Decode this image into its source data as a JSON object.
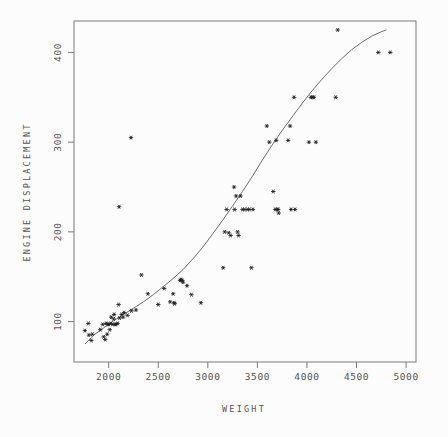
{
  "figure": {
    "background_color": "#fcfcfc",
    "frame_color": "#7a7a7a",
    "marker_color": "#1a1a1a",
    "curve_color": "#6e6e6e",
    "text_color": "#555555"
  },
  "chart_data": {
    "type": "scatter",
    "title": "",
    "subtitle": "",
    "xlabel": "WEIGHT",
    "ylabel": "ENGINE DISPLACEMENT",
    "xlim": [
      1650,
      5100
    ],
    "ylim": [
      55,
      435
    ],
    "xticks": [
      2000,
      2500,
      3000,
      3500,
      4000,
      4500,
      5000
    ],
    "yticks": [
      100,
      200,
      300,
      400
    ],
    "xtick_labels": [
      "2000",
      "2500",
      "3000",
      "3500",
      "4000",
      "4500",
      "5000"
    ],
    "ytick_labels": [
      "100",
      "200",
      "300",
      "400"
    ],
    "grid": false,
    "legend": null,
    "marker_symbol": "asterisk",
    "series": [
      {
        "name": "observations",
        "points": [
          [
            1760,
            90
          ],
          [
            1795,
            98
          ],
          [
            1800,
            85
          ],
          [
            1825,
            79
          ],
          [
            1835,
            86
          ],
          [
            1915,
            91
          ],
          [
            1940,
            97
          ],
          [
            1950,
            83
          ],
          [
            1965,
            80
          ],
          [
            1975,
            98
          ],
          [
            1985,
            86
          ],
          [
            1990,
            97
          ],
          [
            2000,
            97
          ],
          [
            2010,
            91
          ],
          [
            2020,
            98
          ],
          [
            2025,
            105
          ],
          [
            2040,
            97
          ],
          [
            2050,
            103
          ],
          [
            2055,
            108
          ],
          [
            2065,
            97
          ],
          [
            2075,
            97
          ],
          [
            2090,
            98
          ],
          [
            2100,
            119
          ],
          [
            2105,
            228
          ],
          [
            2110,
            104
          ],
          [
            2130,
            108
          ],
          [
            2145,
            105
          ],
          [
            2155,
            110
          ],
          [
            2190,
            107
          ],
          [
            2225,
            305
          ],
          [
            2230,
            112
          ],
          [
            2275,
            113
          ],
          [
            2330,
            152
          ],
          [
            2395,
            131
          ],
          [
            2500,
            119
          ],
          [
            2560,
            137
          ],
          [
            2620,
            122
          ],
          [
            2650,
            131
          ],
          [
            2660,
            121
          ],
          [
            2665,
            120
          ],
          [
            2720,
            146
          ],
          [
            2730,
            147
          ],
          [
            2740,
            146
          ],
          [
            2750,
            144
          ],
          [
            2790,
            140
          ],
          [
            2835,
            130
          ],
          [
            2930,
            121
          ],
          [
            3155,
            160
          ],
          [
            3170,
            200
          ],
          [
            3190,
            225
          ],
          [
            3210,
            199
          ],
          [
            3230,
            196
          ],
          [
            3265,
            250
          ],
          [
            3270,
            225
          ],
          [
            3285,
            240
          ],
          [
            3300,
            200
          ],
          [
            3310,
            196
          ],
          [
            3330,
            240
          ],
          [
            3350,
            225
          ],
          [
            3370,
            225
          ],
          [
            3400,
            225
          ],
          [
            3420,
            225
          ],
          [
            3440,
            160
          ],
          [
            3455,
            225
          ],
          [
            3595,
            318
          ],
          [
            3620,
            300
          ],
          [
            3660,
            245
          ],
          [
            3680,
            225
          ],
          [
            3690,
            302
          ],
          [
            3700,
            225
          ],
          [
            3710,
            225
          ],
          [
            3715,
            221
          ],
          [
            3810,
            302
          ],
          [
            3830,
            318
          ],
          [
            3840,
            225
          ],
          [
            3870,
            350
          ],
          [
            3880,
            225
          ],
          [
            4020,
            300
          ],
          [
            4040,
            350
          ],
          [
            4055,
            350
          ],
          [
            4070,
            350
          ],
          [
            4090,
            300
          ],
          [
            4290,
            350
          ],
          [
            4310,
            425
          ],
          [
            4720,
            400
          ],
          [
            4840,
            400
          ]
        ]
      }
    ],
    "fit_curve": {
      "name": "smoothed fit",
      "points": [
        [
          1760,
          75
        ],
        [
          1850,
          85
        ],
        [
          1950,
          93
        ],
        [
          2050,
          101
        ],
        [
          2150,
          108
        ],
        [
          2250,
          115
        ],
        [
          2350,
          122
        ],
        [
          2450,
          130
        ],
        [
          2550,
          139
        ],
        [
          2650,
          148
        ],
        [
          2750,
          158
        ],
        [
          2850,
          170
        ],
        [
          2950,
          183
        ],
        [
          3050,
          198
        ],
        [
          3150,
          213
        ],
        [
          3250,
          229
        ],
        [
          3350,
          245
        ],
        [
          3450,
          262
        ],
        [
          3550,
          280
        ],
        [
          3650,
          297
        ],
        [
          3750,
          313
        ],
        [
          3850,
          328
        ],
        [
          3950,
          343
        ],
        [
          4050,
          357
        ],
        [
          4150,
          370
        ],
        [
          4250,
          382
        ],
        [
          4350,
          393
        ],
        [
          4450,
          403
        ],
        [
          4550,
          411
        ],
        [
          4650,
          418
        ],
        [
          4750,
          423
        ],
        [
          4800,
          425
        ]
      ]
    }
  }
}
